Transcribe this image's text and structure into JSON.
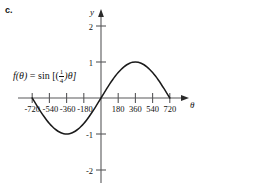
{
  "figure": {
    "part_label": "c.",
    "function_label": {
      "full": "f(θ) = sin [(1/4)θ]",
      "lhs": "f(θ)",
      "equals": "=",
      "operator": "sin",
      "bracket_open": "[(",
      "numerator": "1",
      "denominator": "4",
      "bracket_close": ")θ]"
    },
    "axes": {
      "x_axis_name": "θ",
      "y_axis_name": "y",
      "x_tick_labels": [
        "-720",
        "-540",
        "-360",
        "-180",
        "180",
        "360",
        "540",
        "720"
      ],
      "y_tick_labels": [
        "2",
        "1",
        "-1",
        "-2"
      ]
    },
    "colors": {
      "curve": "#1a1a1a",
      "axis": "#58585a",
      "text": "#111111",
      "background": "#ffffff"
    }
  },
  "chart_data": {
    "type": "line",
    "title": "",
    "subtitle": "",
    "xlabel": "θ",
    "ylabel": "y",
    "function": "f(θ) = sin((1/4)θ)",
    "amplitude": 1,
    "period": 1440,
    "xlim": [
      -810,
      810
    ],
    "ylim": [
      -2.35,
      2.35
    ],
    "xticks": [
      -720,
      -540,
      -360,
      -180,
      180,
      360,
      540,
      720
    ],
    "yticks": [
      2,
      1,
      -1,
      -2
    ],
    "grid": false,
    "legend": false,
    "domain_drawn": [
      -720,
      720
    ],
    "key_points": [
      {
        "x": -720,
        "y": 0
      },
      {
        "x": -540,
        "y": -0.707
      },
      {
        "x": -360,
        "y": -1
      },
      {
        "x": -180,
        "y": -0.707
      },
      {
        "x": 0,
        "y": 0
      },
      {
        "x": 180,
        "y": 0.707
      },
      {
        "x": 360,
        "y": 1
      },
      {
        "x": 540,
        "y": 0.707
      },
      {
        "x": 720,
        "y": 0
      }
    ],
    "series": [
      {
        "name": "f(θ) = sin((1/4)θ)",
        "x": [
          -720,
          -690,
          -660,
          -630,
          -600,
          -570,
          -540,
          -510,
          -480,
          -450,
          -420,
          -390,
          -360,
          -330,
          -300,
          -270,
          -240,
          -210,
          -180,
          -150,
          -120,
          -90,
          -60,
          -30,
          0,
          30,
          60,
          90,
          120,
          150,
          180,
          210,
          240,
          270,
          300,
          330,
          360,
          390,
          420,
          450,
          480,
          510,
          540,
          570,
          600,
          630,
          660,
          690,
          720
        ],
        "values": [
          0,
          -0.131,
          -0.259,
          -0.383,
          -0.5,
          -0.609,
          -0.707,
          -0.793,
          -0.866,
          -0.924,
          -0.966,
          -0.991,
          -1,
          -0.991,
          -0.966,
          -0.924,
          -0.866,
          -0.793,
          -0.707,
          -0.609,
          -0.5,
          -0.383,
          -0.259,
          -0.131,
          0,
          0.131,
          0.259,
          0.383,
          0.5,
          0.609,
          0.707,
          0.793,
          0.866,
          0.924,
          0.966,
          0.991,
          1,
          0.991,
          0.966,
          0.924,
          0.866,
          0.793,
          0.707,
          0.609,
          0.5,
          0.383,
          0.259,
          0.131,
          0
        ]
      }
    ]
  }
}
